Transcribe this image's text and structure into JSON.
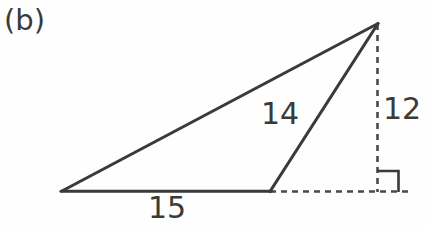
{
  "figure": {
    "panel_label": "(b)",
    "background_color": "#fefefe",
    "stroke_color": "#3a3a3a",
    "dashed_color": "#4a4a4a",
    "text_color": "#3a3a3a"
  },
  "labels": {
    "base": "15",
    "cevian": "14",
    "height": "12"
  },
  "geometry": {
    "vertices": {
      "left_base": [
        62,
        192
      ],
      "mid_base": [
        270,
        192
      ],
      "apex": [
        378,
        23
      ],
      "foot": [
        378,
        192
      ]
    },
    "solid_edges": [
      {
        "name": "hypotenuse",
        "from": [
          62,
          192
        ],
        "to": [
          378,
          23
        ]
      },
      {
        "name": "base",
        "from": [
          62,
          192
        ],
        "to": [
          270,
          192
        ]
      },
      {
        "name": "cevian",
        "from": [
          270,
          192
        ],
        "to": [
          378,
          23
        ]
      }
    ],
    "dashed_edges": [
      {
        "name": "base-extension",
        "from": [
          270,
          192
        ],
        "to": [
          412,
          192
        ]
      },
      {
        "name": "height",
        "from": [
          378,
          23
        ],
        "to": [
          378,
          192
        ]
      }
    ],
    "right_angle_marker": {
      "x": 378,
      "y": 171,
      "size": 21
    }
  }
}
